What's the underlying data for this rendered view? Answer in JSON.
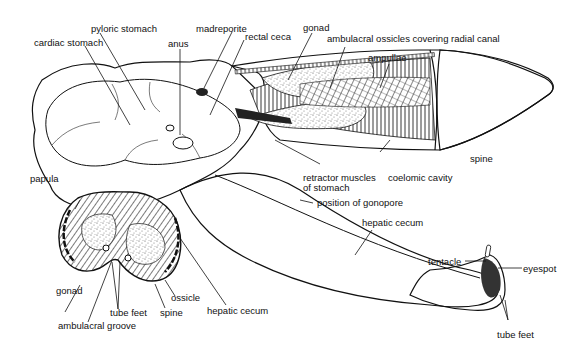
{
  "figure": {
    "colors": {
      "background": "#ffffff",
      "ink": "#111111",
      "stipple": "#777777"
    }
  },
  "labels": {
    "pyloric_stomach": "pyloric stomach",
    "cardiac_stomach": "cardiac stomach",
    "anus": "anus",
    "madreporite": "madreporite",
    "rectal_ceca": "rectal ceca",
    "gonad_top": "gonad",
    "ambulacral_ossicles": "ambulacral ossicles covering radial canal",
    "ampullae": "ampullae",
    "spine_right": "spine",
    "retractor_muscles_1": "retractor muscles",
    "retractor_muscles_2": "of stomach",
    "coelomic_cavity": "coelomic cavity",
    "position_of_gonopore": "position of gonopore",
    "hepatic_cecum_right": "hepatic cecum",
    "papula": "papula",
    "tentacle": "tentacle",
    "eyespot": "eyespot",
    "tube_feet_right": "tube feet",
    "gonad_bottom": "gonad",
    "tube_feet_bottom": "tube feet",
    "ambulacral_groove": "ambulacral groove",
    "spine_bottom": "spine",
    "ossicle": "ossicle",
    "hepatic_cecum_bottom": "hepatic cecum"
  }
}
